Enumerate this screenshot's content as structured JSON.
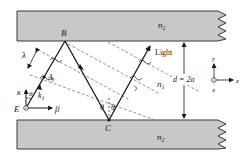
{
  "figure": {
    "type": "slab-waveguide-ray-diagram",
    "colors": {
      "slab_fill": "#c8c8c8",
      "slab_stroke": "#3a3a3a",
      "ray": "#1a1a1a",
      "wavefront": "#777777",
      "background": "#ffffff"
    },
    "cladding_top": {
      "label": "n",
      "subscript": "2"
    },
    "cladding_bottom": {
      "label": "n",
      "subscript": "2"
    },
    "core": {
      "label": "n",
      "subscript": "1"
    },
    "points": {
      "B": "B",
      "C": "C",
      "A": "A",
      "E": "E"
    },
    "light_label": "Light",
    "wavelength_label": "λ",
    "angle_label": "θ",
    "thickness_label": "d = 2a",
    "wavevector": {
      "k_label": "k",
      "k_sub": "1",
      "kappa_label": "κ",
      "beta_label": "β",
      "theta_label": "θ"
    },
    "axes": {
      "y": "y",
      "z": "z",
      "x": "x"
    }
  }
}
